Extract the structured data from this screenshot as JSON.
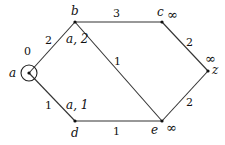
{
  "graph": {
    "nodes": [
      {
        "id": "a",
        "label": "a",
        "x": 29,
        "y": 73,
        "tag": "0",
        "circled": true
      },
      {
        "id": "b",
        "label": "b",
        "x": 75,
        "y": 22,
        "tag": "a, 2"
      },
      {
        "id": "c",
        "label": "c",
        "x": 162,
        "y": 22,
        "tag": "∞"
      },
      {
        "id": "z",
        "label": "z",
        "x": 208,
        "y": 71,
        "tag": "∞"
      },
      {
        "id": "d",
        "label": "d",
        "x": 75,
        "y": 121,
        "tag": "a, 1"
      },
      {
        "id": "e",
        "label": "e",
        "x": 162,
        "y": 121,
        "tag": "∞"
      }
    ],
    "edges": [
      {
        "from": "a",
        "to": "b",
        "weight": "2"
      },
      {
        "from": "a",
        "to": "d",
        "weight": "1"
      },
      {
        "from": "b",
        "to": "c",
        "weight": "3"
      },
      {
        "from": "b",
        "to": "e",
        "weight": "1"
      },
      {
        "from": "d",
        "to": "e",
        "weight": "1"
      },
      {
        "from": "c",
        "to": "z",
        "weight": "2"
      },
      {
        "from": "e",
        "to": "z",
        "weight": "2"
      }
    ]
  }
}
